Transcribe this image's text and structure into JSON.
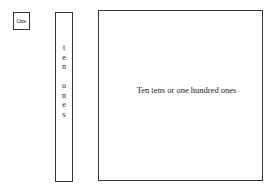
{
  "blocks": {
    "one": {
      "label": "One"
    },
    "ten": {
      "letters": [
        "t",
        "e",
        "n",
        "",
        "o",
        "n",
        "e",
        "s"
      ]
    },
    "hundred": {
      "label": "Ten tens or one hundred ones"
    }
  }
}
